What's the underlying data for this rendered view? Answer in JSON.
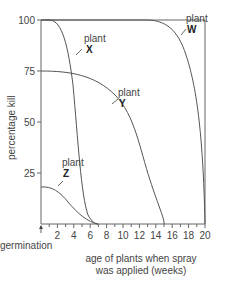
{
  "chart_data": {
    "type": "line",
    "title": "",
    "xlabel": "age of plants when spray was applied (weeks)",
    "xlabel_lines": [
      "age of plants when spray",
      "was applied (weeks)"
    ],
    "ylabel": "percentage kill",
    "x_origin_label": "germination",
    "xlim": [
      0,
      20
    ],
    "ylim": [
      0,
      100
    ],
    "x_ticks": [
      2,
      4,
      6,
      8,
      10,
      12,
      14,
      16,
      18,
      20
    ],
    "y_ticks": [
      25,
      50,
      75,
      100
    ],
    "grid": false,
    "series": [
      {
        "name": "plant W",
        "letter": "W",
        "x": [
          0,
          10,
          12,
          13,
          14,
          15,
          16,
          17,
          18,
          19,
          20
        ],
        "y": [
          100,
          100,
          100,
          99,
          96,
          90,
          80,
          66,
          48,
          25,
          0
        ]
      },
      {
        "name": "plant X",
        "letter": "X",
        "x": [
          0,
          1,
          2,
          3,
          4,
          4.5,
          5,
          5.5,
          6,
          6.5,
          7
        ],
        "y": [
          100,
          100,
          97,
          90,
          75,
          60,
          40,
          22,
          10,
          3,
          0
        ]
      },
      {
        "name": "plant Y",
        "letter": "Y",
        "x": [
          0,
          2,
          4,
          6,
          8,
          9,
          10,
          11,
          12,
          13,
          14,
          15
        ],
        "y": [
          75,
          74,
          71,
          66,
          58,
          52,
          44,
          34,
          22,
          11,
          4,
          0
        ]
      },
      {
        "name": "plant Z",
        "letter": "Z",
        "x": [
          0,
          1,
          2,
          3,
          4,
          5,
          6,
          7
        ],
        "y": [
          18,
          18,
          16,
          13,
          9,
          5,
          2,
          0
        ]
      }
    ]
  },
  "labels": {
    "plant_word": "plant",
    "W": "W",
    "X": "X",
    "Y": "Y",
    "Z": "Z",
    "y_ticks": [
      "100",
      "75",
      "50",
      "25"
    ],
    "x_ticks": [
      "2",
      "4",
      "6",
      "8",
      "10",
      "12",
      "14",
      "16",
      "18",
      "20"
    ],
    "germination": "germination",
    "ylabel": "percentage kill",
    "xlabel_line1": "age of plants when spray",
    "xlabel_line2": "was applied (weeks)"
  }
}
